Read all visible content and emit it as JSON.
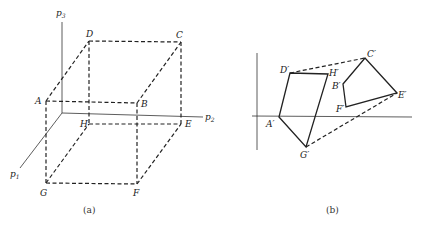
{
  "figure_a": {
    "caption": "(a)",
    "axes": {
      "p3": {
        "label": "p",
        "sub": "3"
      },
      "p2": {
        "label": "p",
        "sub": "2"
      },
      "p1": {
        "label": "p",
        "sub": "1"
      }
    },
    "vertices": {
      "A": "A",
      "B": "B",
      "C": "C",
      "D": "D",
      "E": "E",
      "F": "F",
      "G": "G",
      "H": "H"
    },
    "edge_style": "dashed"
  },
  "figure_b": {
    "caption": "(b)",
    "vertices": {
      "A": "A′",
      "B": "B′",
      "C": "C′",
      "D": "D′",
      "E": "E′",
      "F": "F′",
      "G": "G′",
      "H": "H′"
    },
    "solid_polygons": [
      "A′D′H′G′",
      "B′C′E′F′"
    ],
    "dashed_edges": [
      "D′C′",
      "G′E′"
    ]
  }
}
